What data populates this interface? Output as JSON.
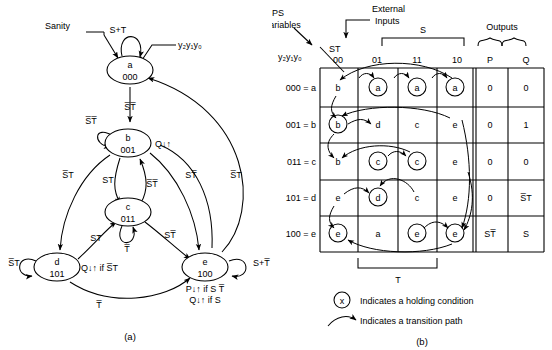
{
  "figure": {
    "caption_a": "(a)",
    "caption_b": "(b)"
  },
  "state_diagram": {
    "states": [
      {
        "id": "a",
        "name": "a",
        "code": "000",
        "output": "",
        "cx": 130,
        "cy": 70
      },
      {
        "id": "b",
        "name": "b",
        "code": "001",
        "output": "Q↓↑",
        "cx": 128,
        "cy": 143
      },
      {
        "id": "c",
        "name": "c",
        "code": "011",
        "output": "",
        "cx": 128,
        "cy": 212
      },
      {
        "id": "d",
        "name": "d",
        "code": "101",
        "output": "Q↓↑ if S̅T",
        "cx": 57,
        "cy": 267
      },
      {
        "id": "e",
        "name": "e",
        "code": "100",
        "output": "P↓↑ if S T̅",
        "output2": "Q↓↑ if S",
        "cx": 205,
        "cy": 267
      }
    ],
    "annotations": {
      "sanity": "Sanity",
      "state_vars": "y₂y₁y₀",
      "self_a": "S+T",
      "self_b": "S̅T̅",
      "self_c": "T̅",
      "self_d": "S̅T",
      "self_e": "S+T̅",
      "a_to_b": "S̅T̅",
      "b_to_c": "ST",
      "c_to_b": "S̅T̅",
      "b_to_d": "S̅T",
      "b_to_e": "ST̅",
      "c_to_d": "ST",
      "c_to_e": "ST̅",
      "d_to_e": "T̅",
      "e_to_a": "S̅T"
    }
  },
  "state_table": {
    "headers": {
      "ps_variables": "PS\nVariables",
      "ps_variables_line1": "PS",
      "ps_variables_line2": "Variables",
      "external_inputs_line1": "External",
      "external_inputs_line2": "Inputs",
      "st": "ST",
      "state_vars": "y₂y₁y₀",
      "outputs": "Outputs",
      "bracket_s": "S",
      "bracket_t": "T"
    },
    "columns": [
      "00",
      "01",
      "11",
      "10"
    ],
    "output_columns": [
      "P",
      "Q"
    ],
    "rows": [
      {
        "label": "000 = a",
        "cells": [
          {
            "text": "b",
            "hold": false
          },
          {
            "text": "a",
            "hold": true
          },
          {
            "text": "a",
            "hold": true
          },
          {
            "text": "a",
            "hold": true
          }
        ],
        "outputs": [
          "0",
          "0"
        ]
      },
      {
        "label": "001 = b",
        "cells": [
          {
            "text": "b",
            "hold": true
          },
          {
            "text": "d",
            "hold": false
          },
          {
            "text": "c",
            "hold": false
          },
          {
            "text": "e",
            "hold": false
          }
        ],
        "outputs": [
          "0",
          "1"
        ]
      },
      {
        "label": "011 = c",
        "cells": [
          {
            "text": "b",
            "hold": false
          },
          {
            "text": "c",
            "hold": true
          },
          {
            "text": "c",
            "hold": true
          },
          {
            "text": "e",
            "hold": false
          }
        ],
        "outputs": [
          "0",
          "0"
        ]
      },
      {
        "label": "101 = d",
        "cells": [
          {
            "text": "e",
            "hold": false
          },
          {
            "text": "d",
            "hold": true
          },
          {
            "text": "c",
            "hold": false
          },
          {
            "text": "e",
            "hold": false
          }
        ],
        "outputs": [
          "0",
          "S̅T"
        ]
      },
      {
        "label": "100 = e",
        "cells": [
          {
            "text": "e",
            "hold": true
          },
          {
            "text": "a",
            "hold": false
          },
          {
            "text": "e",
            "hold": true
          },
          {
            "text": "e",
            "hold": true
          }
        ],
        "outputs": [
          "ST̅",
          "S"
        ]
      }
    ],
    "legend": [
      {
        "symbol": "x",
        "text": "Indicates a holding condition"
      },
      {
        "symbol": "arrow",
        "text": "Indicates a transition path"
      }
    ]
  },
  "colors": {
    "ink": "#000000",
    "paper": "#ffffff"
  }
}
